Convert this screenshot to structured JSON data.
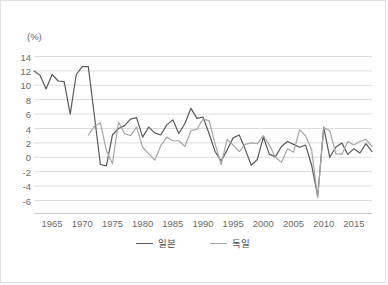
{
  "chart_data": {
    "type": "line",
    "title": "",
    "xlabel": "",
    "ylabel": "(%)",
    "unit_label": "(%)",
    "xlim": [
      1962,
      2018
    ],
    "ylim": [
      -6,
      14
    ],
    "ytick_labels": [
      "14",
      "12",
      "10",
      "8",
      "6",
      "4",
      "2",
      "0",
      "-2",
      "-4",
      "-6"
    ],
    "ytick_values": [
      14,
      12,
      10,
      8,
      6,
      4,
      2,
      0,
      -2,
      -4,
      -6
    ],
    "xtick_labels": [
      "1965",
      "1970",
      "1975",
      "1980",
      "1985",
      "1990",
      "1995",
      "2000",
      "2005",
      "2010",
      "2015"
    ],
    "xtick_values": [
      1965,
      1970,
      1975,
      1980,
      1985,
      1990,
      1995,
      2000,
      2005,
      2010,
      2015
    ],
    "grid": true,
    "legend_position": "bottom",
    "series": [
      {
        "name": "일본",
        "color": "#595959",
        "x": [
          1962,
          1963,
          1964,
          1965,
          1966,
          1967,
          1968,
          1969,
          1970,
          1971,
          1972,
          1973,
          1974,
          1975,
          1976,
          1977,
          1978,
          1979,
          1980,
          1981,
          1982,
          1983,
          1984,
          1985,
          1986,
          1987,
          1988,
          1989,
          1990,
          1991,
          1992,
          1993,
          1994,
          1995,
          1996,
          1997,
          1998,
          1999,
          2000,
          2001,
          2002,
          2003,
          2004,
          2005,
          2006,
          2007,
          2008,
          2009,
          2010,
          2011,
          2012,
          2013,
          2014,
          2015,
          2016,
          2017,
          2018
        ],
        "values": [
          12.0,
          11.4,
          9.5,
          11.5,
          10.6,
          10.5,
          6.0,
          11.5,
          12.6,
          12.6,
          5.8,
          -1.0,
          -1.2,
          3.1,
          4.0,
          4.4,
          5.3,
          5.5,
          2.8,
          4.2,
          3.4,
          3.1,
          4.5,
          5.2,
          3.3,
          4.7,
          6.8,
          5.4,
          5.6,
          3.3,
          0.8,
          -0.5,
          1.0,
          2.7,
          3.1,
          1.1,
          -1.1,
          -0.3,
          2.8,
          0.4,
          0.1,
          1.5,
          2.2,
          1.8,
          1.4,
          1.7,
          -1.1,
          -5.4,
          4.2,
          0.0,
          1.4,
          2.0,
          0.4,
          1.2,
          0.6,
          1.9,
          0.8
        ]
      },
      {
        "name": "독일",
        "color": "#a6a6a6",
        "x": [
          1971,
          1972,
          1973,
          1974,
          1975,
          1976,
          1977,
          1978,
          1979,
          1980,
          1981,
          1982,
          1983,
          1984,
          1985,
          1986,
          1987,
          1988,
          1989,
          1990,
          1991,
          1992,
          1993,
          1994,
          1995,
          1996,
          1997,
          1998,
          1999,
          2000,
          2001,
          2002,
          2003,
          2004,
          2005,
          2006,
          2007,
          2008,
          2009,
          2010,
          2011,
          2012,
          2013,
          2014,
          2015,
          2016,
          2017,
          2018
        ],
        "values": [
          3.1,
          4.3,
          4.8,
          0.9,
          -0.9,
          4.9,
          3.3,
          3.0,
          4.2,
          1.4,
          0.5,
          -0.4,
          1.6,
          2.8,
          2.3,
          2.3,
          1.5,
          3.7,
          3.9,
          5.3,
          5.1,
          1.9,
          -1.0,
          2.5,
          1.7,
          0.8,
          1.8,
          2.0,
          1.9,
          3.0,
          1.7,
          0.0,
          -0.7,
          1.2,
          0.7,
          3.8,
          3.0,
          1.0,
          -5.6,
          4.1,
          3.7,
          0.5,
          0.4,
          2.2,
          1.7,
          2.2,
          2.5,
          1.5
        ]
      }
    ]
  },
  "legend": {
    "items": [
      {
        "label": "일본",
        "color": "#595959"
      },
      {
        "label": "독일",
        "color": "#a6a6a6"
      }
    ]
  }
}
